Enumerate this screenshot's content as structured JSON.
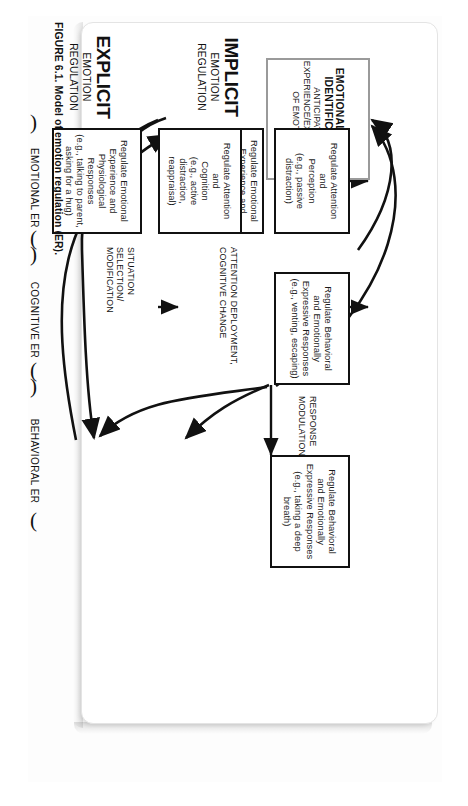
{
  "figure": {
    "caption_number": "FIGURE 6.1.",
    "caption_text": "Model of emotion regulation (ER)."
  },
  "identification": {
    "title": "EMOTIONAL EVENT IDENTIFICATION",
    "subtitle": "ANTICIPATORY EXPERIENCE/EXPRESSION OF EMOTION"
  },
  "modes": [
    {
      "name": "IMPLICIT",
      "sub_line1": "EMOTION",
      "sub_line2": "REGULATION"
    },
    {
      "name": "EXPLICIT",
      "sub_line1": "EMOTION",
      "sub_line2": "REGULATION"
    }
  ],
  "process_labels": [
    {
      "id": "situation",
      "line1": "SITUATION",
      "line2": "SELECTION/",
      "line3": "MODIFICATION"
    },
    {
      "id": "attention",
      "line1": "ATTENTION DEPLOYMENT,",
      "line2": "COGNITIVE CHANGE",
      "line3": ""
    },
    {
      "id": "response",
      "line1": "RESPONSE",
      "line2": "MODULATION",
      "line3": ""
    }
  ],
  "nodes": [
    {
      "id": "implicit-emotional",
      "row": "implicit",
      "column": "emotional",
      "line1": "Regulate Emotional",
      "line2": "Experience and",
      "line3": "Physiological Responses",
      "example": "(e.g., approach–avoidance, self-soothing)"
    },
    {
      "id": "implicit-cognitive",
      "row": "implicit",
      "column": "cognitive",
      "line1": "Regulate Attention",
      "line2": "and",
      "line3": "Perception",
      "example": "(e.g., passive distraction)"
    },
    {
      "id": "implicit-behavioral",
      "row": "implicit",
      "column": "behavioral",
      "line1": "Regulate Behavioral",
      "line2": "and Emotionally",
      "line3": "Expressive Responses",
      "example": "(e.g., venting, escaping)"
    },
    {
      "id": "explicit-emotional",
      "row": "explicit",
      "column": "emotional",
      "line1": "Regulate Emotional",
      "line2": "Experience and",
      "line3": "Physiological Responses",
      "example": "(e.g., talking to parent, asking for a hug)"
    },
    {
      "id": "explicit-cognitive",
      "row": "explicit",
      "column": "cognitive",
      "line1": "Regulate Attention",
      "line2": "and",
      "line3": "Cognition",
      "example": "(e.g., active distraction, reappraisal)"
    },
    {
      "id": "explicit-behavioral",
      "row": "explicit",
      "column": "behavioral",
      "line1": "Regulate Behavioral",
      "line2": "and Emotionally",
      "line3": "Expressive Responses",
      "example": "(e.g., taking a deep breath)"
    }
  ],
  "er_bands": [
    {
      "id": "emotional",
      "label": "EMOTIONAL ER"
    },
    {
      "id": "cognitive",
      "label": "COGNITIVE ER"
    },
    {
      "id": "behavioral",
      "label": "BEHAVIORAL ER"
    }
  ],
  "colors": {
    "ink": "#111111",
    "identification_border": "#9a9a9a",
    "page": "#ffffff",
    "frame_border": "#e4e4e4"
  }
}
